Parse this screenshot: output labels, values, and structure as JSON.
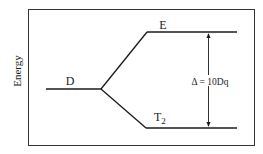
{
  "diagram": {
    "type": "energy-level-splitting",
    "y_axis_label": "Energy",
    "levels": [
      {
        "id": "D",
        "label": "D",
        "role": "unsplit"
      },
      {
        "id": "E",
        "label": "E",
        "role": "upper"
      },
      {
        "id": "T2",
        "label": "T",
        "subscript": "2",
        "role": "lower"
      }
    ],
    "gap_label": "Δ = 10Dq",
    "colors": {
      "line": "#1a1a1a",
      "frame": "#333333",
      "background": "#ffffff"
    }
  }
}
